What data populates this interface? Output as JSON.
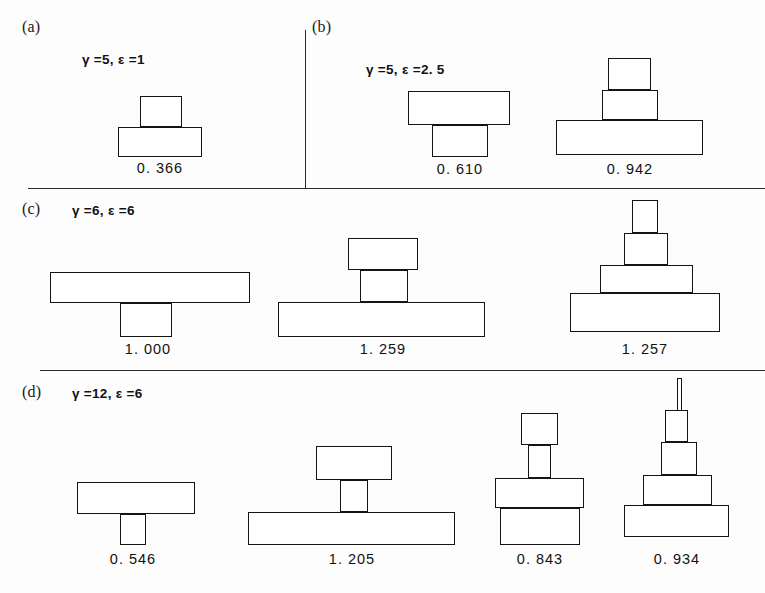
{
  "figure": {
    "width": 765,
    "height": 593,
    "background": "#fdfdfd",
    "stroke_color": "#141414"
  },
  "panels": [
    {
      "tag": "(a)",
      "tag_pos": {
        "x": 22,
        "y": 18
      },
      "params": "γ =5,    ε =1",
      "params_pos": {
        "x": 82,
        "y": 52
      },
      "gamma": 5,
      "epsilon": 1,
      "shapes": [
        {
          "value": "0. 366",
          "value_pos": {
            "x": 160,
            "y": 160
          },
          "blocks": [
            {
              "x": 140,
              "y": 96,
              "w": 42,
              "h": 31
            },
            {
              "x": 118,
              "y": 127,
              "w": 84,
              "h": 30
            }
          ]
        }
      ]
    },
    {
      "tag": "(b)",
      "tag_pos": {
        "x": 312,
        "y": 18
      },
      "params": "γ =5,    ε =2. 5",
      "params_pos": {
        "x": 366,
        "y": 62
      },
      "gamma": 5,
      "epsilon": 2.5,
      "shapes": [
        {
          "value": "0. 610",
          "value_pos": {
            "x": 460,
            "y": 161
          },
          "blocks": [
            {
              "x": 408,
              "y": 91,
              "w": 102,
              "h": 34
            },
            {
              "x": 432,
              "y": 125,
              "w": 56,
              "h": 32
            }
          ]
        },
        {
          "value": "0. 942",
          "value_pos": {
            "x": 630,
            "y": 161
          },
          "blocks": [
            {
              "x": 608,
              "y": 58,
              "w": 43,
              "h": 32
            },
            {
              "x": 602,
              "y": 90,
              "w": 56,
              "h": 30
            },
            {
              "x": 556,
              "y": 120,
              "w": 147,
              "h": 35
            }
          ]
        }
      ]
    },
    {
      "tag": "(c)",
      "tag_pos": {
        "x": 22,
        "y": 200
      },
      "params": "γ =6,    ε =6",
      "params_pos": {
        "x": 72,
        "y": 203
      },
      "gamma": 6,
      "epsilon": 6,
      "shapes": [
        {
          "value": "1. 000",
          "value_pos": {
            "x": 148,
            "y": 341
          },
          "blocks": [
            {
              "x": 50,
              "y": 272,
              "w": 200,
              "h": 31
            },
            {
              "x": 120,
              "y": 303,
              "w": 52,
              "h": 34
            }
          ]
        },
        {
          "value": "1. 259",
          "value_pos": {
            "x": 383,
            "y": 341
          },
          "blocks": [
            {
              "x": 348,
              "y": 238,
              "w": 70,
              "h": 32
            },
            {
              "x": 360,
              "y": 270,
              "w": 48,
              "h": 32
            },
            {
              "x": 278,
              "y": 302,
              "w": 207,
              "h": 35
            }
          ]
        },
        {
          "value": "1. 257",
          "value_pos": {
            "x": 645,
            "y": 341
          },
          "blocks": [
            {
              "x": 632,
              "y": 200,
              "w": 26,
              "h": 33
            },
            {
              "x": 624,
              "y": 233,
              "w": 44,
              "h": 32
            },
            {
              "x": 600,
              "y": 265,
              "w": 93,
              "h": 28
            },
            {
              "x": 570,
              "y": 293,
              "w": 150,
              "h": 39
            }
          ]
        }
      ]
    },
    {
      "tag": "(d)",
      "tag_pos": {
        "x": 22,
        "y": 383
      },
      "params": "γ =12,   ε =6",
      "params_pos": {
        "x": 72,
        "y": 386
      },
      "gamma": 12,
      "epsilon": 6,
      "shapes": [
        {
          "value": "0. 546",
          "value_pos": {
            "x": 133,
            "y": 551
          },
          "blocks": [
            {
              "x": 77,
              "y": 482,
              "w": 118,
              "h": 32
            },
            {
              "x": 120,
              "y": 514,
              "w": 26,
              "h": 31
            }
          ]
        },
        {
          "value": "1. 205",
          "value_pos": {
            "x": 352,
            "y": 551
          },
          "blocks": [
            {
              "x": 316,
              "y": 446,
              "w": 76,
              "h": 34
            },
            {
              "x": 340,
              "y": 480,
              "w": 28,
              "h": 32
            },
            {
              "x": 248,
              "y": 512,
              "w": 207,
              "h": 33
            }
          ]
        },
        {
          "value": "0. 843",
          "value_pos": {
            "x": 540,
            "y": 551
          },
          "blocks": [
            {
              "x": 521,
              "y": 413,
              "w": 37,
              "h": 32
            },
            {
              "x": 528,
              "y": 445,
              "w": 23,
              "h": 33
            },
            {
              "x": 495,
              "y": 478,
              "w": 89,
              "h": 30
            },
            {
              "x": 500,
              "y": 508,
              "w": 80,
              "h": 37
            }
          ]
        },
        {
          "value": "0. 934",
          "value_pos": {
            "x": 677,
            "y": 551
          },
          "spikes": [
            {
              "x": 677,
              "y": 378,
              "w": 5,
              "h": 32
            }
          ],
          "blocks": [
            {
              "x": 665,
              "y": 410,
              "w": 23,
              "h": 32
            },
            {
              "x": 661,
              "y": 442,
              "w": 36,
              "h": 33
            },
            {
              "x": 643,
              "y": 475,
              "w": 69,
              "h": 30
            },
            {
              "x": 624,
              "y": 505,
              "w": 105,
              "h": 32
            }
          ]
        }
      ]
    }
  ],
  "rules": {
    "horizontal": [
      {
        "x": 28,
        "y": 188,
        "w": 737
      },
      {
        "x": 40,
        "y": 370,
        "w": 725
      }
    ],
    "vertical": [
      {
        "x": 305,
        "y": 30,
        "h": 158
      }
    ]
  },
  "chart_data": {
    "type": "diagram",
    "title": "",
    "panels": [
      {
        "tag": "(a)",
        "gamma": 5,
        "epsilon": 1,
        "values": [
          0.366
        ]
      },
      {
        "tag": "(b)",
        "gamma": 5,
        "epsilon": 2.5,
        "values": [
          0.61,
          0.942
        ]
      },
      {
        "tag": "(c)",
        "gamma": 6,
        "epsilon": 6,
        "values": [
          1.0,
          1.259,
          1.257
        ]
      },
      {
        "tag": "(d)",
        "gamma": 12,
        "epsilon": 6,
        "values": [
          0.546,
          1.205,
          0.843,
          0.934
        ]
      }
    ]
  }
}
